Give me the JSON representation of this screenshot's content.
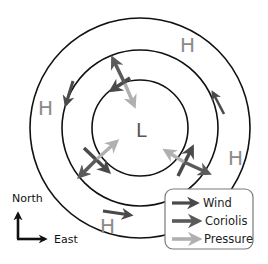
{
  "diagram": {
    "center_label": "L",
    "high_labels": [
      "H",
      "H",
      "H",
      "H"
    ],
    "isobars": [
      {
        "name": "inner",
        "radius": 48
      },
      {
        "name": "middle",
        "radius": 78
      },
      {
        "name": "outer",
        "radius": 110
      }
    ],
    "compass": {
      "north_label": "North",
      "east_label": "East"
    },
    "legend": {
      "items": [
        {
          "label": "Wind",
          "color": "#4a4a4a"
        },
        {
          "label": "Coriolis",
          "color": "#5a5a5a"
        },
        {
          "label": "Pressure",
          "color": "#b0b0b0"
        }
      ]
    },
    "colors": {
      "wind": "#4a4a4a",
      "coriolis": "#5a5a5a",
      "pressure": "#b0b0b0",
      "isobar": "#111111",
      "high_label": "#8a8a8a"
    }
  }
}
